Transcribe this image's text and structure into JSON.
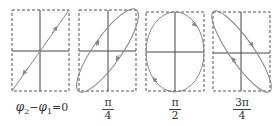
{
  "figure": {
    "panels": [
      {
        "id": "panel-0",
        "shape": "line",
        "label_type": "equation",
        "label": {
          "phi2": "φ",
          "sub2": "2",
          "minus": "−",
          "phi1": "φ",
          "sub1": "1",
          "eq": "=0"
        }
      },
      {
        "id": "panel-pi4",
        "shape": "tilted-ellipse",
        "label_type": "fraction",
        "label": {
          "num": "π",
          "den": "4"
        }
      },
      {
        "id": "panel-pi2",
        "shape": "ellipse",
        "label_type": "fraction",
        "label": {
          "num": "π",
          "den": "2"
        }
      },
      {
        "id": "panel-3pi4",
        "shape": "tilted-ellipse-reversed",
        "label_type": "fraction",
        "label": {
          "num": "3π",
          "den": "4"
        }
      }
    ],
    "colors": {
      "axis": "#444444",
      "curve": "#888888",
      "frame": "#555555"
    }
  }
}
